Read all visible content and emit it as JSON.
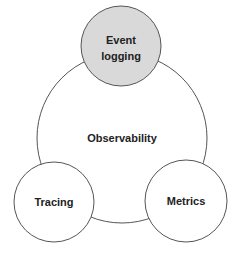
{
  "diagram": {
    "center": {
      "label": "Observability"
    },
    "nodes": [
      {
        "id": "event-logging",
        "lines": [
          "Event",
          "logging"
        ],
        "fill": "#d9d9d9"
      },
      {
        "id": "tracing",
        "lines": [
          "Tracing"
        ],
        "fill": "#ffffff"
      },
      {
        "id": "metrics",
        "lines": [
          "Metrics"
        ],
        "fill": "#ffffff"
      }
    ],
    "stroke_color": "#555555"
  }
}
